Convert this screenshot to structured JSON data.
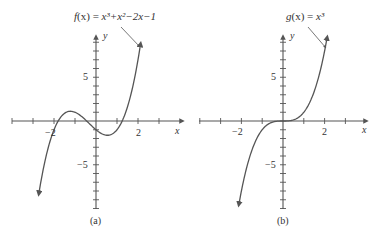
{
  "colors": {
    "axis": "#555555",
    "curve": "#555555",
    "text": "#333333",
    "background": "#ffffff"
  },
  "chart_data": [
    {
      "type": "line",
      "panel_label": "(a)",
      "title": "f(x) = x³+x²−2x−1",
      "function": "x^3 + x^2 - 2x - 1",
      "xlabel": "x",
      "ylabel": "y",
      "xlim": [
        -4,
        4
      ],
      "ylim": [
        -10,
        10
      ],
      "x_tick_step": 1,
      "y_tick_step": 1,
      "x_tick_labels": [
        {
          "value": -2,
          "label": "−2"
        },
        {
          "value": 2,
          "label": "2"
        }
      ],
      "y_tick_labels": [
        {
          "value": 5,
          "label": "5"
        },
        {
          "value": -5,
          "label": "−5"
        }
      ],
      "domain_plotted": [
        -2.72,
        2.12
      ],
      "grid": false,
      "series": [
        {
          "name": "f(x)",
          "x": [
            -2.7,
            -2.5,
            -2,
            -1.8,
            -1.5,
            -1.2,
            -1,
            -0.7,
            -0.5,
            -0.2,
            0,
            0.3,
            0.6,
            0.8,
            1,
            1.3,
            1.5,
            1.8,
            2,
            2.1
          ],
          "values": [
            -6.323,
            -4.375,
            -1,
            -0.392,
            0.875,
            1.232,
            1,
            0.547,
            0.125,
            -0.568,
            -1,
            -1.483,
            -1.624,
            -1.448,
            -1,
            0.087,
            1.625,
            4.072,
            7,
            8.471
          ]
        }
      ],
      "annotation": {
        "text": "f(x) = x³+x²−2x−1",
        "arrow_to": [
          1.85,
          4.6
        ]
      }
    },
    {
      "type": "line",
      "panel_label": "(b)",
      "title": "g(x) = x³",
      "function": "x^3",
      "xlabel": "x",
      "ylabel": "y",
      "xlim": [
        -4,
        4
      ],
      "ylim": [
        -10,
        10
      ],
      "x_tick_step": 1,
      "y_tick_step": 1,
      "x_tick_labels": [
        {
          "value": -2,
          "label": "−2"
        },
        {
          "value": 2,
          "label": "2"
        }
      ],
      "y_tick_labels": [
        {
          "value": 5,
          "label": "5"
        },
        {
          "value": -5,
          "label": "−5"
        }
      ],
      "domain_plotted": [
        -2.12,
        2.12
      ],
      "grid": false,
      "series": [
        {
          "name": "g(x)",
          "x": [
            -2.1,
            -2,
            -1.5,
            -1,
            -0.5,
            0,
            0.5,
            1,
            1.5,
            2,
            2.1
          ],
          "values": [
            -9.261,
            -8,
            -3.375,
            -1,
            -0.125,
            0,
            0.125,
            1,
            3.375,
            8,
            9.261
          ]
        }
      ],
      "annotation": {
        "text": "g(x) = x³",
        "arrow_to": [
          1.85,
          6.3
        ]
      }
    }
  ],
  "panels": [
    {
      "id": "a",
      "caption": "(a)",
      "func_label_prefix": "f",
      "func_label_var": "(x)",
      "func_label_eq": " = ",
      "func_label_rhs": "x³+x²−2x−1",
      "axis_x_label": "x",
      "axis_y_label": "y",
      "tick_minus2": "−2",
      "tick_2": "2",
      "tick_5": "5",
      "tick_minus5": "−5"
    },
    {
      "id": "b",
      "caption": "(b)",
      "func_label_prefix": "g",
      "func_label_var": "(x)",
      "func_label_eq": " = ",
      "func_label_rhs": "x³",
      "axis_x_label": "x",
      "axis_y_label": "y",
      "tick_minus2": "−2",
      "tick_2": "2",
      "tick_5": "5",
      "tick_minus5": "−5"
    }
  ]
}
